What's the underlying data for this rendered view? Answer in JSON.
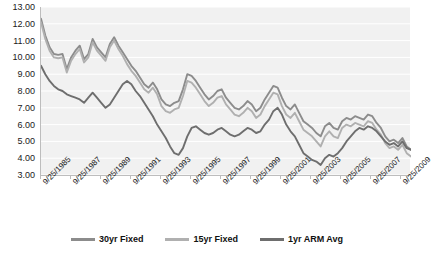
{
  "chart_data": {
    "type": "line",
    "title": "",
    "xlabel": "",
    "ylabel": "",
    "ylim": [
      3.0,
      13.0
    ],
    "ytick_step": 1.0,
    "grid": true,
    "legend_position": "bottom",
    "ytick_labels": [
      "13.00",
      "12.00",
      "11.00",
      "10.00",
      "9.00",
      "8.00",
      "7.00",
      "6.00",
      "5.00",
      "4.00",
      "3.00"
    ],
    "xtick_labels": [
      "9/25/1985",
      "9/25/1987",
      "9/25/1989",
      "9/25/1991",
      "9/25/1993",
      "9/25/1995",
      "9/25/1997",
      "9/25/1999",
      "9/25/2001",
      "9/25/2003",
      "9/25/2005",
      "9/25/2007",
      "9/25/2009"
    ],
    "x_label_interval_years": 2,
    "x_start": "9/25/1985",
    "x_end": "9/25/2010",
    "series": [
      {
        "name": "30yr Fixed",
        "color": "#8c8c8c",
        "values": [
          12.3,
          11.3,
          10.6,
          10.2,
          10.15,
          10.2,
          9.3,
          10.0,
          10.4,
          10.7,
          9.9,
          10.2,
          11.1,
          10.6,
          10.3,
          10.0,
          10.8,
          11.2,
          10.7,
          10.3,
          9.9,
          9.5,
          9.2,
          8.8,
          8.4,
          8.2,
          8.5,
          8.1,
          7.5,
          7.2,
          7.1,
          7.3,
          7.4,
          8.1,
          9.0,
          8.9,
          8.6,
          8.2,
          7.8,
          7.5,
          7.7,
          8.0,
          8.1,
          7.6,
          7.3,
          7.0,
          6.9,
          7.1,
          7.4,
          7.2,
          6.8,
          7.0,
          7.5,
          7.9,
          8.3,
          8.2,
          7.6,
          7.1,
          6.9,
          7.2,
          6.7,
          6.2,
          6.0,
          5.8,
          5.5,
          5.3,
          5.9,
          6.1,
          5.8,
          5.7,
          6.2,
          6.4,
          6.3,
          6.5,
          6.4,
          6.3,
          6.6,
          6.5,
          6.1,
          5.8,
          5.3,
          5.0,
          5.1,
          4.9,
          5.2,
          4.7,
          4.5
        ],
        "notes": "30-year fixed mortgage rate; peaks near 11.2 in 1989-1990, troughs near 4.5 at series end"
      },
      {
        "name": "15yr Fixed",
        "color": "#b0b0b0",
        "values": [
          12.1,
          11.1,
          10.4,
          10.0,
          9.95,
          10.0,
          9.1,
          9.8,
          10.2,
          10.5,
          9.7,
          10.0,
          10.9,
          10.4,
          10.1,
          9.8,
          10.6,
          11.0,
          10.5,
          10.1,
          9.6,
          9.2,
          8.9,
          8.5,
          8.1,
          7.9,
          8.2,
          7.8,
          7.1,
          6.8,
          6.7,
          6.9,
          7.0,
          7.7,
          8.6,
          8.5,
          8.2,
          7.8,
          7.4,
          7.1,
          7.3,
          7.6,
          7.7,
          7.2,
          6.9,
          6.6,
          6.5,
          6.7,
          7.0,
          6.8,
          6.4,
          6.6,
          7.1,
          7.5,
          7.9,
          7.8,
          7.1,
          6.6,
          6.4,
          6.7,
          6.2,
          5.7,
          5.5,
          5.3,
          5.0,
          4.7,
          5.3,
          5.6,
          5.3,
          5.2,
          5.8,
          6.0,
          5.9,
          6.1,
          6.0,
          5.9,
          6.2,
          6.1,
          5.7,
          5.4,
          4.9,
          4.6,
          4.7,
          4.5,
          4.8,
          4.3,
          4.1
        ],
        "notes": "15-year fixed mortgage rate; consistently ~0.2-0.5 below 30yr fixed"
      },
      {
        "name": "1yr ARM Avg",
        "color": "#6e6e6e",
        "values": [
          9.5,
          9.0,
          8.6,
          8.3,
          8.1,
          8.0,
          7.8,
          7.7,
          7.6,
          7.5,
          7.3,
          7.6,
          7.9,
          7.6,
          7.3,
          7.0,
          7.2,
          7.6,
          8.0,
          8.4,
          8.6,
          8.4,
          8.0,
          7.7,
          7.3,
          6.9,
          6.5,
          6.0,
          5.6,
          5.2,
          4.7,
          4.3,
          4.2,
          4.6,
          5.3,
          5.8,
          5.9,
          5.7,
          5.5,
          5.4,
          5.5,
          5.7,
          5.8,
          5.6,
          5.4,
          5.3,
          5.4,
          5.6,
          5.8,
          5.7,
          5.5,
          5.6,
          6.0,
          6.3,
          6.8,
          7.0,
          6.6,
          6.0,
          5.6,
          5.3,
          4.8,
          4.3,
          4.1,
          3.9,
          3.8,
          3.6,
          4.0,
          4.2,
          4.1,
          4.3,
          4.6,
          5.0,
          5.3,
          5.6,
          5.8,
          5.7,
          5.9,
          5.8,
          5.6,
          5.3,
          5.0,
          4.8,
          4.9,
          4.7,
          5.0,
          4.6,
          4.5
        ],
        "notes": "1-year adjustable rate mortgage average; lowest series, troughs near 3.6 in 2003-2004"
      }
    ]
  },
  "legend": {
    "items": [
      {
        "label": "30yr Fixed",
        "color": "#8c8c8c"
      },
      {
        "label": "15yr Fixed",
        "color": "#b0b0b0"
      },
      {
        "label": "1yr ARM Avg",
        "color": "#6e6e6e"
      }
    ]
  },
  "style": {
    "plot_background": "#f1f1f1",
    "gridline_color": "#ffffff",
    "axis_color": "#bdbdbd",
    "text_color": "#1a1a1a"
  }
}
